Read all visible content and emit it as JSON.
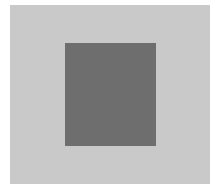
{
  "image": {
    "description": "Light gray square field with a centered darker gray rectangle",
    "colors": {
      "background": "#ffffff",
      "outer_square": "#c9c9c9",
      "inner_rectangle": "#6e6e6e"
    }
  }
}
